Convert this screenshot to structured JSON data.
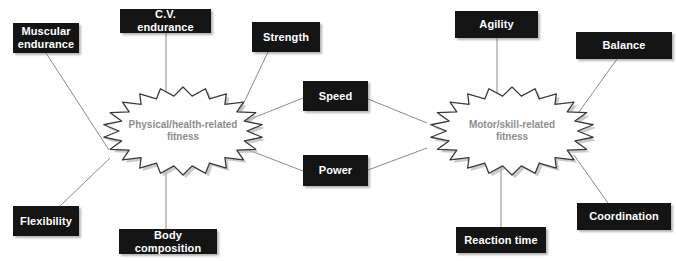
{
  "diagram": {
    "colors": {
      "box_fill": "#141414",
      "box_text": "#ffffff",
      "burst_text": "#8e8e8e",
      "burst_outline": "#3a3a3a",
      "edge_line": "#8b8b8b",
      "background": "#ffffff"
    },
    "clusters": [
      {
        "id": "physical",
        "label": "Physical/health-related\nfitness",
        "center": {
          "x": 183,
          "y": 131
        }
      },
      {
        "id": "motor",
        "label": "Motor/skill-related\nfitness",
        "center": {
          "x": 512,
          "y": 131
        }
      }
    ],
    "nodes": [
      {
        "id": "muscular-endurance",
        "label": "Muscular\nendurance",
        "x": 13,
        "y": 23,
        "w": 66,
        "h": 30
      },
      {
        "id": "cv-endurance",
        "label": "C.V. endurance",
        "x": 120,
        "y": 9,
        "w": 91,
        "h": 24
      },
      {
        "id": "strength",
        "label": "Strength",
        "x": 252,
        "y": 22,
        "w": 68,
        "h": 30
      },
      {
        "id": "speed",
        "label": "Speed",
        "x": 303,
        "y": 81,
        "w": 65,
        "h": 30
      },
      {
        "id": "power",
        "label": "Power",
        "x": 303,
        "y": 155,
        "w": 65,
        "h": 31
      },
      {
        "id": "flexibility",
        "label": "Flexibility",
        "x": 13,
        "y": 206,
        "w": 66,
        "h": 30
      },
      {
        "id": "body-composition",
        "label": "Body composition",
        "x": 119,
        "y": 229,
        "w": 98,
        "h": 25
      },
      {
        "id": "agility",
        "label": "Agility",
        "x": 455,
        "y": 11,
        "w": 83,
        "h": 27
      },
      {
        "id": "balance",
        "label": "Balance",
        "x": 576,
        "y": 32,
        "w": 96,
        "h": 27
      },
      {
        "id": "reaction-time",
        "label": "Reaction time",
        "x": 456,
        "y": 227,
        "w": 90,
        "h": 26
      },
      {
        "id": "coordination",
        "label": "Coordination",
        "x": 577,
        "y": 203,
        "w": 94,
        "h": 27
      }
    ],
    "edges": [
      {
        "from": "muscular-endurance",
        "to": "physical"
      },
      {
        "from": "cv-endurance",
        "to": "physical"
      },
      {
        "from": "strength",
        "to": "physical"
      },
      {
        "from": "flexibility",
        "to": "physical"
      },
      {
        "from": "body-composition",
        "to": "physical"
      },
      {
        "from": "speed",
        "to": "physical"
      },
      {
        "from": "power",
        "to": "physical"
      },
      {
        "from": "speed",
        "to": "motor"
      },
      {
        "from": "power",
        "to": "motor"
      },
      {
        "from": "agility",
        "to": "motor"
      },
      {
        "from": "balance",
        "to": "motor"
      },
      {
        "from": "reaction-time",
        "to": "motor"
      },
      {
        "from": "coordination",
        "to": "motor"
      }
    ]
  }
}
